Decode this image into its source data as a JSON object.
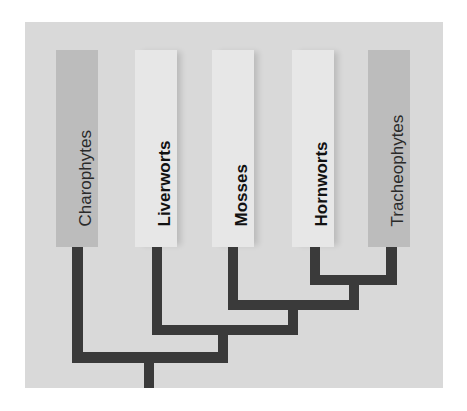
{
  "diagram": {
    "type": "cladogram",
    "colors": {
      "panel_background": "#d9d9d9",
      "highlighted_taxon_box": "#e7e7e7",
      "muted_taxon_box": "#bcbcbc",
      "branch_line": "#3a3a3a"
    },
    "taxa": [
      {
        "label": "Charophytes",
        "style": "muted"
      },
      {
        "label": "Liverworts",
        "style": "highlighted"
      },
      {
        "label": "Mosses",
        "style": "highlighted"
      },
      {
        "label": "Hornworts",
        "style": "highlighted"
      },
      {
        "label": "Tracheophytes",
        "style": "muted"
      }
    ],
    "topology": "(Charophytes,(Liverworts,(Mosses,(Hornworts,Tracheophytes))))"
  }
}
